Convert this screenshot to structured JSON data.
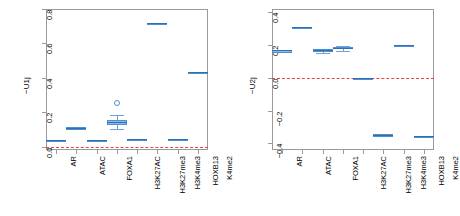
{
  "figure": {
    "type": "boxplot-pair",
    "background": "#ffffff",
    "box_fill": "#8cb9e8",
    "box_border": "#4f8fd0",
    "median_color": "#2f6fb5",
    "reference_line_color": "#e8443a",
    "axis_color": "#9a9a9a"
  },
  "chart_data": [
    {
      "type": "bar",
      "subtype": "boxplot",
      "title": "",
      "xlabel": "",
      "ylabel": "−U1j",
      "ylim": [
        -0.02,
        0.8
      ],
      "yticks": [
        0.0,
        0.2,
        0.4,
        0.6,
        0.8
      ],
      "ytick_labels": [
        "0.0",
        "0.2",
        "0.4",
        "0.6",
        "0.8"
      ],
      "grid": false,
      "legend": "none",
      "reference_line": 0.0,
      "categories": [
        "AR",
        "ATAC",
        "FOXA1",
        "H3K27AC",
        "H3K27me3",
        "H3K4me3",
        "HOXB13",
        "K4me2"
      ],
      "boxes": [
        {
          "category": "AR",
          "min": 0.036,
          "q1": 0.037,
          "median": 0.038,
          "q3": 0.039,
          "max": 0.04,
          "outliers": []
        },
        {
          "category": "ATAC",
          "min": 0.108,
          "q1": 0.109,
          "median": 0.11,
          "q3": 0.111,
          "max": 0.112,
          "outliers": []
        },
        {
          "category": "FOXA1",
          "min": 0.036,
          "q1": 0.037,
          "median": 0.038,
          "q3": 0.039,
          "max": 0.04,
          "outliers": []
        },
        {
          "category": "H3K27AC",
          "min": 0.105,
          "q1": 0.126,
          "median": 0.14,
          "q3": 0.155,
          "max": 0.185,
          "outliers": [
            0.255
          ]
        },
        {
          "category": "H3K27me3",
          "min": 0.043,
          "q1": 0.044,
          "median": 0.045,
          "q3": 0.046,
          "max": 0.047,
          "outliers": []
        },
        {
          "category": "H3K4me3",
          "min": 0.718,
          "q1": 0.719,
          "median": 0.72,
          "q3": 0.721,
          "max": 0.722,
          "outliers": []
        },
        {
          "category": "HOXB13",
          "min": 0.04,
          "q1": 0.041,
          "median": 0.042,
          "q3": 0.043,
          "max": 0.044,
          "outliers": []
        },
        {
          "category": "K4me2",
          "min": 0.429,
          "q1": 0.43,
          "median": 0.431,
          "q3": 0.432,
          "max": 0.433,
          "outliers": []
        }
      ]
    },
    {
      "type": "bar",
      "subtype": "boxplot",
      "title": "",
      "xlabel": "",
      "ylabel": "−U2j",
      "ylim": [
        -0.44,
        0.42
      ],
      "yticks": [
        -0.4,
        -0.2,
        0.0,
        0.2,
        0.4
      ],
      "ytick_labels": [
        "−0.4",
        "−0.2",
        "0.0",
        "0.2",
        "0.4"
      ],
      "grid": false,
      "legend": "none",
      "reference_line": 0.0,
      "categories": [
        "AR",
        "ATAC",
        "FOXA1",
        "H3K27AC",
        "H3K27me3",
        "H3K4me3",
        "HOXB13",
        "K4me2"
      ],
      "boxes": [
        {
          "category": "AR",
          "min": 0.165,
          "q1": 0.166,
          "median": 0.167,
          "q3": 0.168,
          "max": 0.169,
          "outliers": []
        },
        {
          "category": "ATAC",
          "min": 0.308,
          "q1": 0.309,
          "median": 0.31,
          "q3": 0.311,
          "max": 0.312,
          "outliers": []
        },
        {
          "category": "FOXA1",
          "min": 0.152,
          "q1": 0.16,
          "median": 0.168,
          "q3": 0.175,
          "max": 0.182,
          "outliers": []
        },
        {
          "category": "H3K27AC",
          "min": 0.165,
          "q1": 0.174,
          "median": 0.18,
          "q3": 0.187,
          "max": 0.196,
          "outliers": []
        },
        {
          "category": "H3K27me3",
          "min": -0.004,
          "q1": -0.002,
          "median": 0.0,
          "q3": 0.002,
          "max": 0.004,
          "outliers": []
        },
        {
          "category": "H3K4me3",
          "min": -0.348,
          "q1": -0.347,
          "median": -0.346,
          "q3": -0.345,
          "max": -0.344,
          "outliers": []
        },
        {
          "category": "HOXB13",
          "min": 0.186,
          "q1": 0.192,
          "median": 0.198,
          "q3": 0.203,
          "max": 0.209,
          "outliers": []
        },
        {
          "category": "K4me2",
          "min": -0.356,
          "q1": -0.355,
          "median": -0.354,
          "q3": -0.353,
          "max": -0.352,
          "outliers": []
        }
      ]
    }
  ]
}
